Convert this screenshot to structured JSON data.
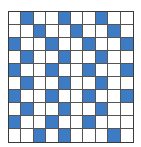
{
  "grid": {
    "rows": 10,
    "cols": 10,
    "fill_color": "#3d7cc4",
    "empty_color": "#ffffff",
    "line_color": "#555555",
    "cells": [
      [
        0,
        1,
        0,
        0,
        1,
        0,
        0,
        1,
        0,
        0
      ],
      [
        0,
        0,
        1,
        0,
        0,
        1,
        0,
        0,
        1,
        0
      ],
      [
        1,
        0,
        0,
        1,
        0,
        0,
        1,
        0,
        0,
        1
      ],
      [
        0,
        1,
        0,
        0,
        1,
        0,
        0,
        1,
        0,
        0
      ],
      [
        1,
        0,
        0,
        1,
        0,
        0,
        1,
        0,
        0,
        1
      ],
      [
        0,
        1,
        0,
        0,
        1,
        0,
        0,
        1,
        0,
        0
      ],
      [
        1,
        0,
        0,
        1,
        0,
        0,
        1,
        0,
        0,
        1
      ],
      [
        0,
        1,
        0,
        0,
        1,
        0,
        0,
        1,
        0,
        0
      ],
      [
        1,
        0,
        0,
        1,
        0,
        0,
        1,
        0,
        0,
        0
      ],
      [
        0,
        0,
        1,
        0,
        1,
        0,
        0,
        0,
        1,
        0
      ]
    ]
  }
}
